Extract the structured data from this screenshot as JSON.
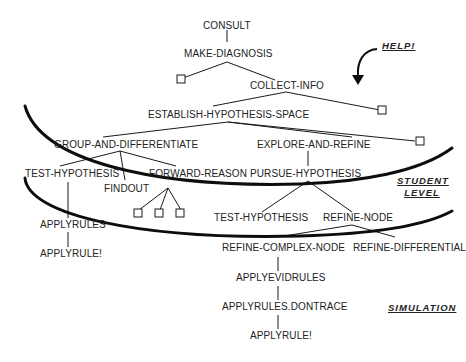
{
  "diagram": {
    "colors": {
      "ink": "#1a1a1a",
      "background": "#ffffff"
    },
    "nodes": {
      "consult": "CONSULT",
      "make_diagnosis": "MAKE-DIAGNOSIS",
      "collect_info": "COLLECT-INFO",
      "establish_hypothesis_space": "ESTABLISH-HYPOTHESIS-SPACE",
      "group_and_differentiate": "GROUP-AND-DIFFERENTIATE",
      "explore_and_refine": "EXPLORE-AND-REFINE",
      "test_hypothesis_left": "TEST-HYPOTHESIS",
      "findout": "FINDOUT",
      "forward_reason": "FORWARD-REASON",
      "pursue_hypothesis": "PURSUE-HYPOTHESIS",
      "applyrules": "APPLYRULES",
      "applyrule_left": "APPLYRULE!",
      "test_hypothesis_right": "TEST-HYPOTHESIS",
      "refine_node": "REFINE-NODE",
      "refine_complex_node": "REFINE-COMPLEX-NODE",
      "refine_differential": "REFINE-DIFFERENTIAL",
      "applyevidrules": "APPLYEVIDRULES",
      "applyrules_dontrace": "APPLYRULES.DONTRACE",
      "applyrule_right": "APPLYRULE!"
    },
    "labels": {
      "help": "HELP!",
      "student_level_line1": "STUDENT",
      "student_level_line2": "LEVEL",
      "simulation": "SIMULATION"
    },
    "icons": {
      "placeholder_box": "empty-square",
      "help_arrow": "curved-arrow-down",
      "level_boundary": "thick-curved-line"
    }
  }
}
